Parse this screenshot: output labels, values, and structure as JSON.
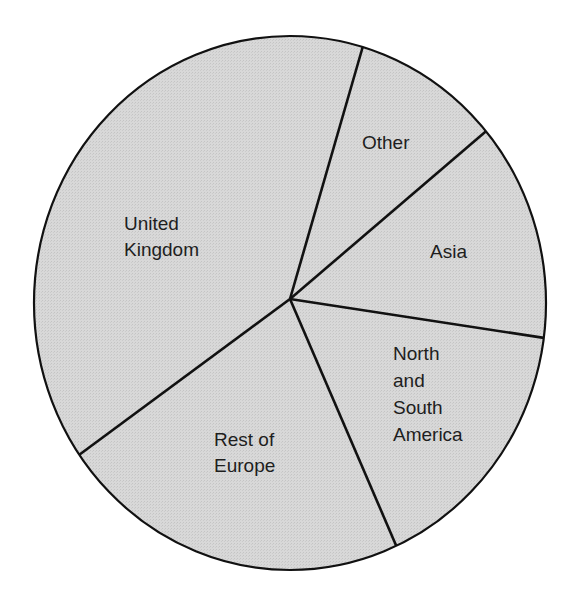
{
  "chart_data": {
    "type": "pie",
    "title": "",
    "start_angle_deg_clockwise_from_top": 16.5,
    "slices": [
      {
        "label": "Other",
        "lines": [
          "Other"
        ],
        "value": 9.3
      },
      {
        "label": "Asia",
        "lines": [
          "Asia"
        ],
        "value": 13.2
      },
      {
        "label": "North and South America",
        "lines": [
          "North",
          "and",
          "South",
          "America"
        ],
        "value": 16.1
      },
      {
        "label": "Rest of Europe",
        "lines": [
          "Rest of",
          "Europe"
        ],
        "value": 22.2
      },
      {
        "label": "United Kingdom",
        "lines": [
          "United",
          "Kingdom"
        ],
        "value": 39.2
      }
    ],
    "legend": "none (labels inside slices)",
    "colors": {
      "fill": "#d6d6d6",
      "stroke": "#111111",
      "text": "#1e1e1e"
    }
  },
  "labels": {
    "other": "Other",
    "asia": "Asia",
    "nsa": "North\nand\nSouth\nAmerica",
    "europe": "Rest of\nEurope",
    "uk": "United\nKingdom"
  }
}
